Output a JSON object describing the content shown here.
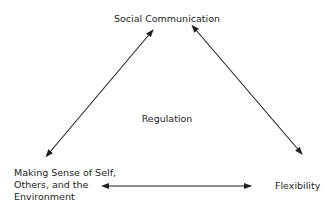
{
  "diagram": {
    "nodes": {
      "top": "Social Communication",
      "center": "Regulation",
      "bottom_left": [
        "Making Sense of Self,",
        "Others, and the",
        "Environment"
      ],
      "bottom_right": "Flexibility"
    },
    "edges": [
      {
        "from": "Making Sense of Self, Others, and the Environment",
        "to": "Social Communication",
        "type": "bidirectional"
      },
      {
        "from": "Social Communication",
        "to": "Flexibility",
        "type": "bidirectional"
      },
      {
        "from": "Making Sense of Self, Others, and the Environment",
        "to": "Flexibility",
        "type": "bidirectional"
      }
    ],
    "colors": {
      "line": "#231f20",
      "text": "#231f20",
      "background": "#ffffff"
    }
  }
}
